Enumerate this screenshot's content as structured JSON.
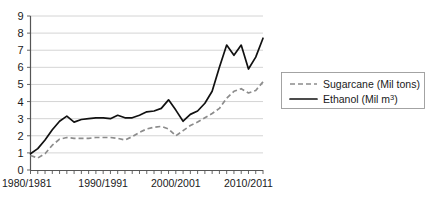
{
  "chart_data": {
    "type": "line",
    "title": "",
    "xlabel": "",
    "ylabel": "",
    "ylim": [
      0,
      9
    ],
    "yticks": [
      0,
      1,
      2,
      3,
      4,
      5,
      6,
      7,
      8,
      9
    ],
    "grid": true,
    "legend_position": "right",
    "x_tick_labels": [
      "1980/1981",
      "1990/1991",
      "2000/2001",
      "2010/2011"
    ],
    "x_tick_label_years": [
      1980,
      1990,
      2000,
      2010
    ],
    "x_minor_tick_count": 33,
    "x": [
      1980,
      1981,
      1982,
      1983,
      1984,
      1985,
      1986,
      1987,
      1988,
      1989,
      1990,
      1991,
      1992,
      1993,
      1994,
      1995,
      1996,
      1997,
      1998,
      1999,
      2000,
      2001,
      2002,
      2003,
      2004,
      2005,
      2006,
      2007,
      2008,
      2009,
      2010,
      2011,
      2012
    ],
    "series": [
      {
        "name": "Sugarcane (Mil tons)",
        "style": "dashed",
        "color": "#8c8c8c",
        "values": [
          0.85,
          0.7,
          0.95,
          1.45,
          1.8,
          1.9,
          1.85,
          1.85,
          1.85,
          1.9,
          1.9,
          1.9,
          1.85,
          1.75,
          1.95,
          2.2,
          2.4,
          2.5,
          2.55,
          2.4,
          2.0,
          2.3,
          2.6,
          2.8,
          3.05,
          3.3,
          3.6,
          4.2,
          4.6,
          4.75,
          4.5,
          4.65,
          5.15
        ]
      },
      {
        "name": "Ethanol (Mil m³)",
        "style": "solid",
        "color": "#111111",
        "values": [
          0.95,
          1.25,
          1.75,
          2.35,
          2.85,
          3.15,
          2.8,
          2.95,
          3.0,
          3.05,
          3.05,
          3.0,
          3.2,
          3.05,
          3.05,
          3.2,
          3.4,
          3.45,
          3.6,
          4.1,
          3.5,
          2.85,
          3.25,
          3.45,
          3.9,
          4.6,
          6.0,
          7.3,
          6.7,
          7.3,
          5.9,
          6.6,
          7.7
        ]
      }
    ],
    "legend": [
      {
        "label": "Sugarcane (Mil tons)",
        "style": "dashed"
      },
      {
        "label": "Ethanol (Mil m³)",
        "style": "solid"
      }
    ]
  },
  "legend": {
    "sugarcane_label": "Sugarcane (Mil tons)",
    "ethanol_label_prefix": "Ethanol (Mil m",
    "ethanol_label_sup": "3",
    "ethanol_label_suffix": ")"
  }
}
